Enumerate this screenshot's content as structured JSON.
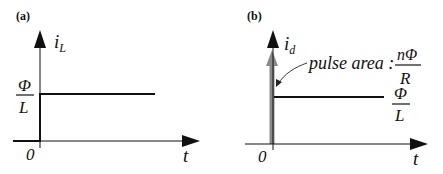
{
  "panels": [
    {
      "label": "(a)",
      "y_axis_label": "i",
      "y_axis_subscript": "L",
      "x_axis_label": "t",
      "origin_label": "0",
      "level_numerator": "Φ",
      "level_denominator": "L"
    },
    {
      "label": "(b)",
      "y_axis_label": "i",
      "y_axis_subscript": "d",
      "x_axis_label": "t",
      "origin_label": "0",
      "annotation_text": "pulse area :",
      "annotation_numerator": "nΦ",
      "annotation_denominator": "R",
      "level_numerator": "Φ",
      "level_denominator": "L"
    }
  ],
  "colors": {
    "line": "#111111",
    "impulse": "#8a8a8a"
  }
}
